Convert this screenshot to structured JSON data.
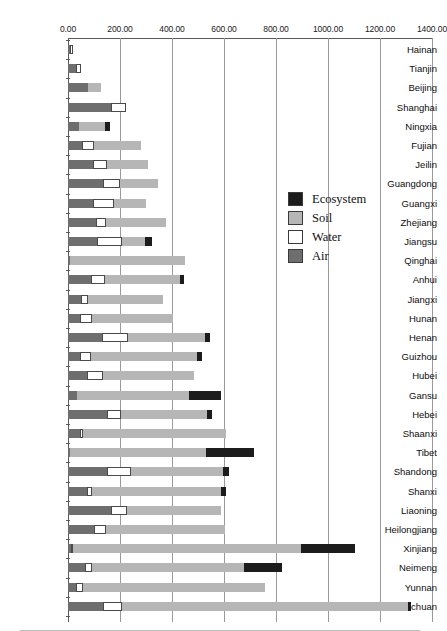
{
  "chart_data": {
    "type": "bar",
    "orientation": "horizontal",
    "stacked": true,
    "title": "",
    "xlabel": "",
    "ylabel": "",
    "xlim": [
      0,
      1400
    ],
    "xticks": [
      0,
      200,
      400,
      600,
      800,
      1000,
      1200,
      1400
    ],
    "xtick_labels": [
      "0.00",
      "200.00",
      "400.00",
      "600.00",
      "800.00",
      "1000.00",
      "1200.00",
      "1400.00"
    ],
    "grid": true,
    "legend_position": "center-right",
    "legend": [
      "Ecosystem",
      "Soil",
      "Water",
      "Air"
    ],
    "series_order_in_stack": [
      "Air",
      "Water",
      "Soil",
      "Ecosystem"
    ],
    "colors": {
      "Ecosystem": "#1c1c1c",
      "Soil": "#b6b6b6",
      "Water": "#ffffff",
      "Air": "#6e6e6e"
    },
    "categories": [
      "Hainan",
      "Tianjin",
      "Beijing",
      "Shanghai",
      "Ningxia",
      "Fujian",
      "Jeilin",
      "Guangdong",
      "Guangxi",
      "Zhejiang",
      "Jiangsu",
      "Qinghai",
      "Anhui",
      "Jiangxi",
      "Hunan",
      "Henan",
      "Guizhou",
      "Hubei",
      "Gansu",
      "Hebei",
      "Shaanxi",
      "Tibet",
      "Shandong",
      "Shanxi",
      "Liaoning",
      "Heilongjiang",
      "Xinjiang",
      "Neimeng",
      "Yunnan",
      "Sichuan"
    ],
    "series": [
      {
        "name": "Air",
        "values": [
          8,
          31,
          77,
          165,
          42,
          54,
          96,
          135,
          96,
          108,
          112,
          8,
          88,
          50,
          46,
          130,
          46,
          73,
          34,
          150,
          46,
          8,
          150,
          73,
          165,
          100,
          12,
          65,
          31,
          135
        ]
      },
      {
        "name": "Water",
        "values": [
          10,
          19,
          0,
          58,
          0,
          46,
          54,
          65,
          80,
          38,
          96,
          0,
          54,
          27,
          46,
          100,
          42,
          62,
          0,
          54,
          12,
          0,
          92,
          19,
          62,
          46,
          8,
          27,
          27,
          73
        ]
      },
      {
        "name": "Soil",
        "values": [
          0,
          0,
          50,
          0,
          100,
          181,
          158,
          146,
          123,
          230,
          88,
          442,
          288,
          288,
          312,
          296,
          408,
          350,
          430,
          330,
          550,
          523,
          354,
          496,
          360,
          458,
          877,
          584,
          700,
          1098
        ]
      },
      {
        "name": "Ecosystem",
        "values": [
          0,
          0,
          0,
          0,
          19,
          0,
          0,
          0,
          0,
          0,
          27,
          0,
          15,
          0,
          0,
          19,
          19,
          0,
          123,
          19,
          0,
          184,
          23,
          19,
          0,
          0,
          208,
          146,
          0,
          15
        ]
      }
    ],
    "totals": [
      18,
      50,
      127,
      223,
      161,
      281,
      308,
      346,
      299,
      376,
      323,
      450,
      445,
      365,
      404,
      545,
      515,
      485,
      587,
      553,
      608,
      715,
      619,
      607,
      587,
      604,
      1105,
      822,
      758,
      1321
    ]
  }
}
